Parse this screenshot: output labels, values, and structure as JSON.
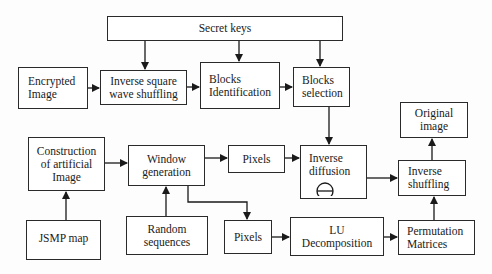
{
  "diagram": {
    "nodes": {
      "secret_keys": {
        "label": "Secret keys"
      },
      "encrypted_image": {
        "label": "Encrypted\nImage"
      },
      "inverse_square_wave": {
        "label": "Inverse square\nwave shuffling"
      },
      "blocks_identification": {
        "label": "Blocks\nIdentification"
      },
      "blocks_selection": {
        "label": "Blocks\nselection"
      },
      "original_image": {
        "label": "Original\nimage"
      },
      "construction_artificial": {
        "label": "Construction\nof artificial\nImage"
      },
      "window_generation": {
        "label": "Window\ngeneration"
      },
      "pixels_top": {
        "label": "Pixels"
      },
      "inverse_diffusion": {
        "label": "Inverse\ndiffusion",
        "symbol": "circle-minus-operator"
      },
      "inverse_shuffling": {
        "label": "Inverse\nshuffling"
      },
      "jsmp_map": {
        "label": "JSMP map"
      },
      "random_sequences": {
        "label": "Random\nsequences"
      },
      "pixels_bottom": {
        "label": "Pixels"
      },
      "lu_decomposition": {
        "label": "LU\nDecomposition"
      },
      "permutation_matrices": {
        "label": "Permutation\nMatrices"
      }
    },
    "edges": [
      [
        "secret_keys",
        "inverse_square_wave"
      ],
      [
        "secret_keys",
        "blocks_identification"
      ],
      [
        "secret_keys",
        "blocks_selection"
      ],
      [
        "encrypted_image",
        "inverse_square_wave"
      ],
      [
        "inverse_square_wave",
        "blocks_identification"
      ],
      [
        "blocks_identification",
        "blocks_selection"
      ],
      [
        "blocks_selection",
        "inverse_diffusion"
      ],
      [
        "jsmp_map",
        "construction_artificial"
      ],
      [
        "construction_artificial",
        "window_generation"
      ],
      [
        "random_sequences",
        "window_generation"
      ],
      [
        "window_generation",
        "pixels_top"
      ],
      [
        "window_generation",
        "pixels_bottom"
      ],
      [
        "pixels_top",
        "inverse_diffusion"
      ],
      [
        "pixels_bottom",
        "lu_decomposition"
      ],
      [
        "lu_decomposition",
        "permutation_matrices"
      ],
      [
        "permutation_matrices",
        "inverse_shuffling"
      ],
      [
        "inverse_diffusion",
        "inverse_shuffling"
      ],
      [
        "inverse_shuffling",
        "original_image"
      ]
    ]
  }
}
